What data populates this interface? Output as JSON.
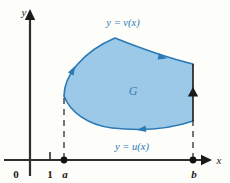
{
  "figure": {
    "background_color": "#fdfdfa",
    "axes": {
      "x_axis_label": "x",
      "y_axis_label": "y",
      "origin_label": "0",
      "axis_color": "#2e2e2e",
      "ticks": [
        {
          "label": "1",
          "kind": "tick-mark"
        },
        {
          "label": "a",
          "kind": "filled-dot"
        },
        {
          "label": "b",
          "kind": "filled-dot"
        }
      ]
    },
    "region": {
      "label": "G",
      "fill_color": "#9cc9e8",
      "stroke_color": "#2b7ab5",
      "label_color": "#3a7fb8"
    },
    "curves": [
      {
        "name": "upper-curve",
        "label": "y = v(x)",
        "color": "#2b7ab5",
        "orientation": "right-to-left"
      },
      {
        "name": "lower-curve",
        "label": "y = u(x)",
        "color": "#2b7ab5",
        "orientation": "left-to-right"
      },
      {
        "name": "right-edge",
        "label": "",
        "color": "#1a1a1a",
        "orientation": "upward"
      }
    ],
    "guides": {
      "left_dashed_line": "x = a",
      "right_dashed_line": "x = b",
      "dash_color": "#2e2e2e"
    },
    "arrows": [
      {
        "name": "upper-curve-arrow-right",
        "direction": "left"
      },
      {
        "name": "upper-curve-arrow-left",
        "direction": "down-left"
      },
      {
        "name": "lower-curve-arrow",
        "direction": "right"
      },
      {
        "name": "right-edge-arrow",
        "direction": "up"
      }
    ]
  }
}
